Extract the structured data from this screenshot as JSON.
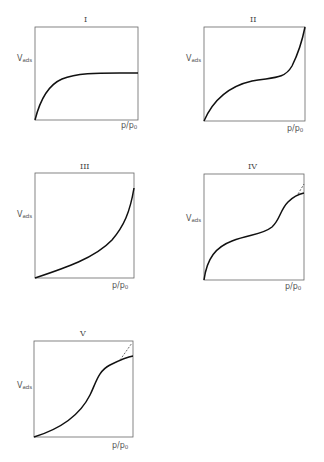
{
  "figure": {
    "y_axis_label": "V",
    "y_axis_sub": "ads",
    "x_axis_label": "p/p",
    "x_axis_sub": "0",
    "line_color": "#111111",
    "frame_color": "#666666",
    "panels": [
      {
        "id": "I",
        "numeral": "I",
        "box": [
          35,
          27,
          103,
          93
        ]
      },
      {
        "id": "II",
        "numeral": "II",
        "box": [
          204,
          27,
          101,
          94
        ]
      },
      {
        "id": "III",
        "numeral": "III",
        "box": [
          35,
          173,
          99,
          105
        ]
      },
      {
        "id": "IV",
        "numeral": "IV",
        "box": [
          204,
          174,
          100,
          106
        ]
      },
      {
        "id": "V",
        "numeral": "V",
        "box": [
          34,
          341,
          99,
          96
        ]
      }
    ]
  }
}
